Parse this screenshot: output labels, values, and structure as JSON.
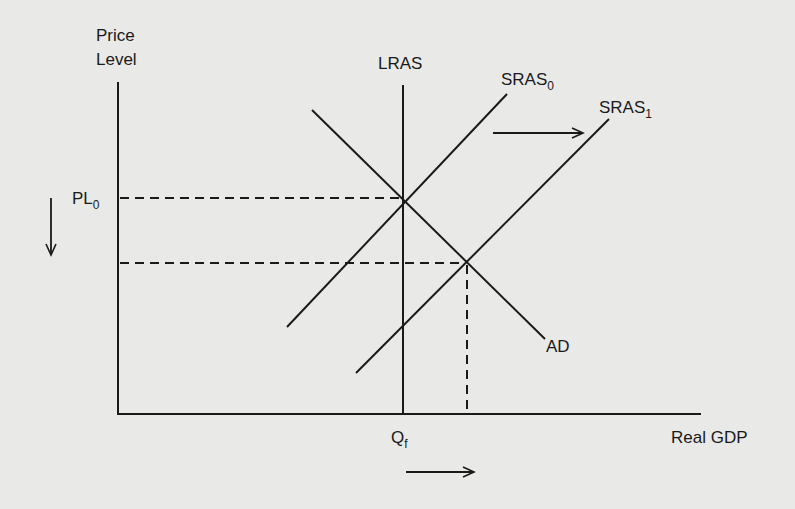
{
  "diagram": {
    "type": "aggregate-demand-aggregate-supply",
    "y_axis_label_line1": "Price",
    "y_axis_label_line2": "Level",
    "x_axis_label": "Real GDP",
    "curves": {
      "lras": "LRAS",
      "sras0_base": "SRAS",
      "sras0_sub": "0",
      "sras1_base": "SRAS",
      "sras1_sub": "1",
      "ad": "AD"
    },
    "y_marks": {
      "pl0_base": "PL",
      "pl0_sub": "0"
    },
    "x_marks": {
      "qf_base": "Q",
      "qf_sub": "f"
    },
    "arrows": {
      "sras_shift": "right",
      "price_level_change": "down",
      "real_gdp_change": "right"
    },
    "colors": {
      "background": "#e9e9e7",
      "ink": "#1a1a1a"
    }
  }
}
